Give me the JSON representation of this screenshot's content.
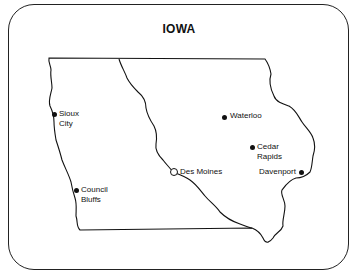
{
  "title": "IOWA",
  "colors": {
    "ink": "#111111",
    "background": "#ffffff"
  },
  "cities": [
    {
      "name": "Sioux City",
      "line1": "Sioux",
      "line2": "City",
      "type": "city"
    },
    {
      "name": "Waterloo",
      "line1": "Waterloo",
      "type": "city"
    },
    {
      "name": "Cedar Rapids",
      "line1": "Cedar",
      "line2": "Rapids",
      "type": "city"
    },
    {
      "name": "Des Moines",
      "line1": "Des Moines",
      "type": "capital"
    },
    {
      "name": "Davenport",
      "line1": "Davenport",
      "type": "city"
    },
    {
      "name": "Council Bluffs",
      "line1": "Council",
      "line2": "Bluffs",
      "type": "city"
    }
  ]
}
